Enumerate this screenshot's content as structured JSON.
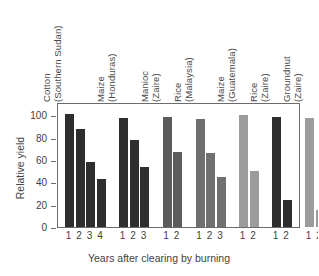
{
  "chart_data": {
    "type": "bar",
    "title": "",
    "xlabel": "Years after clearing by burning",
    "ylabel": "Relative yield",
    "ylim": [
      0,
      112
    ],
    "yticks": [
      0,
      20,
      40,
      60,
      80,
      100
    ],
    "grid": false,
    "legend": false,
    "categories": [
      "1",
      "2",
      "3",
      "4",
      "1",
      "2",
      "3",
      "1",
      "2",
      "1",
      "2",
      "3",
      "1",
      "2",
      "1",
      "2",
      "1",
      "2"
    ],
    "values": [
      101,
      88,
      58,
      43,
      98,
      78,
      54,
      99,
      67,
      97,
      66,
      45,
      100,
      50,
      99,
      24,
      98,
      15
    ],
    "groups": [
      {
        "crop": "Cotton",
        "place": "(Southern Sudan)",
        "color": "#2e2e2e",
        "years": [
          "1",
          "2",
          "3",
          "4"
        ],
        "values": [
          101,
          88,
          58,
          43
        ]
      },
      {
        "crop": "Maize",
        "place": "(Honduras)",
        "color": "#2e2e2e",
        "years": [
          "1",
          "2",
          "3"
        ],
        "values": [
          98,
          78,
          54
        ]
      },
      {
        "crop": "Manioc",
        "place": "(Zaire)",
        "color": "#5c5c5c",
        "years": [
          "1",
          "2"
        ],
        "values": [
          99,
          67
        ]
      },
      {
        "crop": "Rice",
        "place": "(Malaysia)",
        "color": "#6f6f6f",
        "years": [
          "1",
          "2",
          "3"
        ],
        "values": [
          97,
          66,
          45
        ]
      },
      {
        "crop": "Maize",
        "place": "(Guatemala)",
        "color": "#9c9c9c",
        "years": [
          "1",
          "2"
        ],
        "values": [
          100,
          50
        ]
      },
      {
        "crop": "Rice",
        "place": "(Zaire)",
        "color": "#2e2e2e",
        "years": [
          "1",
          "2"
        ],
        "values": [
          99,
          24
        ]
      },
      {
        "crop": "Groundnut",
        "place": "(Zaire)",
        "color": "#9c9c9c",
        "years": [
          "1",
          "2"
        ],
        "values": [
          98,
          15
        ]
      }
    ]
  },
  "axes": {
    "y_title": "Relative yield",
    "x_title": "Years after clearing by burning",
    "y_tick_labels": [
      "0",
      "20",
      "40",
      "60",
      "80",
      "100"
    ]
  },
  "colors": {
    "frame": "#6b6b6b",
    "text": "#3f3f3f",
    "background": "#ffffff",
    "bar_dark": "#2e2e2e",
    "bar_darkgray": "#5c5c5c",
    "bar_midgray": "#6f6f6f",
    "bar_lightgray": "#9c9c9c"
  }
}
